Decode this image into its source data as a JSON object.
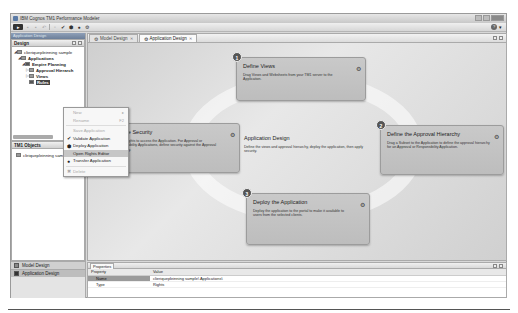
{
  "window": {
    "title": "IBM Cognos TM1 Performance Modeler",
    "controls": [
      "minimize",
      "maximize",
      "close"
    ]
  },
  "toolbar": {
    "buttons": [
      {
        "name": "menu-button",
        "glyph": "▸"
      },
      {
        "name": "save-button",
        "glyph": "▪"
      },
      {
        "name": "save-all-button",
        "glyph": "▪"
      },
      {
        "name": "undo-button",
        "glyph": "↶"
      },
      {
        "name": "open-button",
        "glyph": "▫"
      },
      {
        "name": "validate-button",
        "glyph": "✔"
      },
      {
        "name": "deploy-button",
        "glyph": "⬢"
      },
      {
        "name": "transfer-button",
        "glyph": "●"
      },
      {
        "name": "settings-button",
        "glyph": "⚙"
      }
    ],
    "help_glyph": "?",
    "dropdown_glyph": "▾"
  },
  "left_panel": {
    "perspective_label": "Application Design",
    "design_panel": {
      "title": "Design",
      "tree": [
        {
          "label": "clieriquepleinning sample",
          "level": 0,
          "arrow": "◢",
          "bold": false
        },
        {
          "label": "Applications",
          "level": 1,
          "arrow": "◢",
          "bold": true
        },
        {
          "label": "Empire Planning",
          "level": 2,
          "arrow": "◢",
          "bold": true,
          "special": true
        },
        {
          "label": "Approval Hierarch",
          "level": 3,
          "arrow": "▷",
          "bold": true
        },
        {
          "label": "Views",
          "level": 3,
          "arrow": "▷",
          "bold": true
        },
        {
          "label": "Rules",
          "level": 3,
          "arrow": "",
          "bold": true,
          "selected": true
        }
      ]
    },
    "tm1_objects_panel": {
      "title": "TM1 Objects",
      "tree": [
        {
          "label": "cliriquepleinning sample"
        }
      ]
    },
    "bottom_tabs": [
      {
        "label": "Model Design",
        "active": false
      },
      {
        "label": "Application Design",
        "active": true
      }
    ]
  },
  "context_menu": {
    "items": [
      {
        "label": "New",
        "disabled": true,
        "submenu": true,
        "shortcut": "▸"
      },
      {
        "label": "Rename",
        "disabled": true,
        "shortcut": "F2"
      },
      {
        "separator": true
      },
      {
        "label": "Save Application",
        "disabled": true
      },
      {
        "label": "Validate Application",
        "icon": "✔"
      },
      {
        "label": "Deploy Application",
        "icon": "⬢"
      },
      {
        "label": "Open Rights Editor",
        "highlighted": true
      },
      {
        "label": "Transfer Application",
        "icon": "●"
      },
      {
        "separator": true
      },
      {
        "label": "Delete",
        "disabled": true,
        "icon": "✖"
      }
    ]
  },
  "editor": {
    "tabs": [
      {
        "label": "Model Design",
        "active": false
      },
      {
        "label": "Application Design",
        "active": true
      }
    ],
    "center": {
      "title": "Application Design",
      "description": "Define the views and approval hierarchy, deploy the application, then apply security."
    },
    "steps": [
      {
        "number": "1",
        "title": "Define Views",
        "description": "Drag Views and Websheets from your TM1 server to the Application."
      },
      {
        "number": "2",
        "title": "Define the Approval Hierarchy",
        "description": "Drag a Subset to the Application to define the approval hierarchy for an Approval or Responsibility Application."
      },
      {
        "number": "3",
        "title": "Deploy the Application",
        "description": "Deploy the application to the portal to make it available to users from the selected clients."
      },
      {
        "number": "4",
        "title": "Define Security",
        "description": "Define rights to access the Application. For Approval or Responsibility Applications, define security against the Approval Hierarchy."
      }
    ]
  },
  "properties": {
    "tab_label": "Properties",
    "columns": [
      "Property",
      "Value"
    ],
    "rows": [
      {
        "property": "Name",
        "value": "clieriquepleinning sample\\ Applications\\ ",
        "selected": true
      },
      {
        "property": "Type",
        "value": "Rights",
        "selected": false
      }
    ]
  }
}
